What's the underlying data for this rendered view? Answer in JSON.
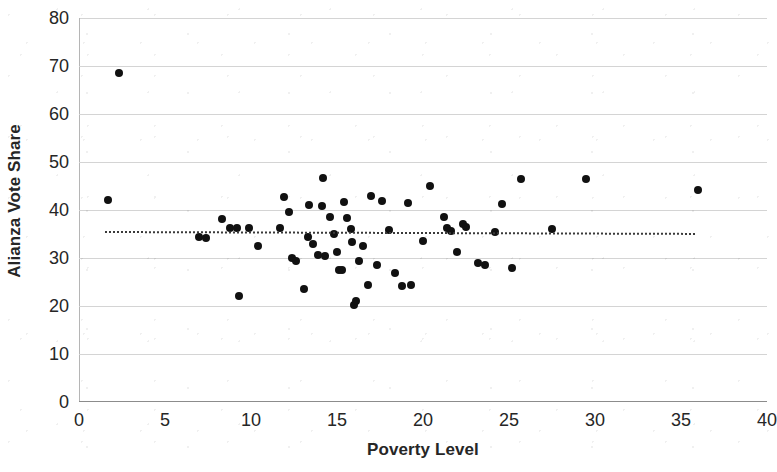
{
  "chart_data": {
    "type": "scatter",
    "title": "",
    "xlabel": "Poverty Level",
    "ylabel": "Alianza Vote Share",
    "xlim": [
      0,
      40
    ],
    "ylim": [
      0,
      80
    ],
    "xticks": [
      "0",
      "5",
      "10",
      "15",
      "20",
      "25",
      "30",
      "35",
      "40"
    ],
    "yticks": [
      "0",
      "10",
      "20",
      "30",
      "40",
      "50",
      "60",
      "70",
      "80"
    ],
    "grid": "horizontal",
    "legend": "none",
    "marker_color": "#111111",
    "gridline_color": "#d4d4d4",
    "series": [
      {
        "name": "Municipalities",
        "marker": "circle",
        "points": [
          [
            1.7,
            42.0
          ],
          [
            2.3,
            68.5
          ],
          [
            7.0,
            34.4
          ],
          [
            7.4,
            34.2
          ],
          [
            8.3,
            38.2
          ],
          [
            8.8,
            36.2
          ],
          [
            9.2,
            36.3
          ],
          [
            9.3,
            22.0
          ],
          [
            9.9,
            36.2
          ],
          [
            10.4,
            32.4
          ],
          [
            11.7,
            36.3
          ],
          [
            11.9,
            42.7
          ],
          [
            12.2,
            39.6
          ],
          [
            12.4,
            30.1
          ],
          [
            12.6,
            29.3
          ],
          [
            13.1,
            23.6
          ],
          [
            13.3,
            34.4
          ],
          [
            13.4,
            41.1
          ],
          [
            13.6,
            33.0
          ],
          [
            13.9,
            30.6
          ],
          [
            14.1,
            40.9
          ],
          [
            14.2,
            46.6
          ],
          [
            14.3,
            30.5
          ],
          [
            14.6,
            38.6
          ],
          [
            14.8,
            34.9
          ],
          [
            15.0,
            31.2
          ],
          [
            15.1,
            27.6
          ],
          [
            15.3,
            27.4
          ],
          [
            15.4,
            41.6
          ],
          [
            15.6,
            38.3
          ],
          [
            15.8,
            36.0
          ],
          [
            15.9,
            33.4
          ],
          [
            16.0,
            20.3
          ],
          [
            16.1,
            21.1
          ],
          [
            16.3,
            29.4
          ],
          [
            16.5,
            32.6
          ],
          [
            16.8,
            24.4
          ],
          [
            17.0,
            43.0
          ],
          [
            17.3,
            28.5
          ],
          [
            17.6,
            41.9
          ],
          [
            18.0,
            35.8
          ],
          [
            18.4,
            26.8
          ],
          [
            18.8,
            24.2
          ],
          [
            19.1,
            41.5
          ],
          [
            19.3,
            24.3
          ],
          [
            20.0,
            33.6
          ],
          [
            20.4,
            45.0
          ],
          [
            21.2,
            38.5
          ],
          [
            21.4,
            36.2
          ],
          [
            21.6,
            35.6
          ],
          [
            22.0,
            31.3
          ],
          [
            22.3,
            37.1
          ],
          [
            22.5,
            36.4
          ],
          [
            23.2,
            29.0
          ],
          [
            23.6,
            28.6
          ],
          [
            24.2,
            35.5
          ],
          [
            24.6,
            41.3
          ],
          [
            25.2,
            28.0
          ],
          [
            25.7,
            46.4
          ],
          [
            27.5,
            36.0
          ],
          [
            29.5,
            46.4
          ],
          [
            36.0,
            44.1
          ]
        ]
      }
    ],
    "trendline": {
      "style": "dotted",
      "color": "#3a3a3a",
      "x_start": 1.5,
      "y_start": 35.6,
      "x_end": 35.8,
      "y_end": 35.2
    }
  }
}
